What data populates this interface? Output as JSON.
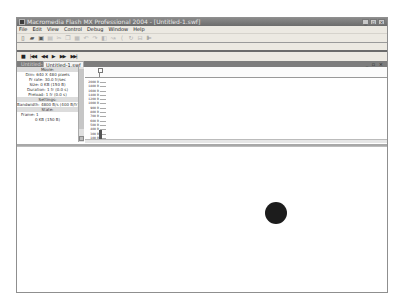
{
  "window": {
    "title": "Macromedia Flash MX Professional 2004 - [Untitled-1.swf]",
    "controls": [
      "minimize-icon",
      "maximize-icon",
      "close-icon"
    ]
  },
  "menu": [
    "File",
    "Edit",
    "View",
    "Control",
    "Debug",
    "Window",
    "Help"
  ],
  "toolbar": {
    "icons": [
      "new-icon",
      "open-icon",
      "save-icon",
      "print-icon",
      "cut-icon",
      "copy-icon",
      "paste-icon",
      "undo-icon",
      "redo-icon",
      "snap-icon",
      "smooth-icon",
      "straighten-icon",
      "rotate-icon",
      "scale-icon",
      "align-icon"
    ]
  },
  "controller": {
    "buttons": [
      {
        "name": "stop-button",
        "glyph": "■"
      },
      {
        "name": "rewind-button",
        "glyph": "|◀◀"
      },
      {
        "name": "step-back-button",
        "glyph": "◀◀"
      },
      {
        "name": "play-button",
        "glyph": "▶"
      },
      {
        "name": "step-forward-button",
        "glyph": "▶▶"
      },
      {
        "name": "go-to-end-button",
        "glyph": "▶▶|"
      }
    ]
  },
  "tabs": [
    {
      "label": "Untitled-1*",
      "active": false
    },
    {
      "label": "Untitled-1.swf",
      "active": true
    }
  ],
  "doc_controls": "_ ▫ ×",
  "profiler": {
    "info": [
      {
        "text": "Movie:",
        "section": true
      },
      {
        "text": "Dim: 640 X 480 pixels"
      },
      {
        "text": "Fr rate: 30.0 fr/sec"
      },
      {
        "text": "Size: 0 KB (150 B)"
      },
      {
        "text": "Duration: 1 fr (0.0 s)"
      },
      {
        "text": "Preload: 1 fr (0.0 s)"
      },
      {
        "text": "Settings:",
        "section": true
      },
      {
        "text": "Bandwidth: 4800 B/s (400 B/fr)"
      },
      {
        "text": "State:",
        "section": true
      },
      {
        "text": "Frame: 1",
        "left": true
      },
      {
        "text": "0 KB (150 B)"
      }
    ],
    "y_labels": [
      "2000 B",
      "1800 B",
      "1600 B",
      "1400 B",
      "1200 B",
      "1000 B",
      "900 B",
      "800 B",
      "700 B",
      "600 B",
      "500 B",
      "400 B",
      "300 B",
      "100 B"
    ],
    "current_frame": 1,
    "frame_bytes": 150
  },
  "stage": {
    "background": "#ffffff",
    "ball": {
      "cx": 275,
      "cy": 201,
      "r": 11,
      "color": "#1c1c1c"
    }
  }
}
